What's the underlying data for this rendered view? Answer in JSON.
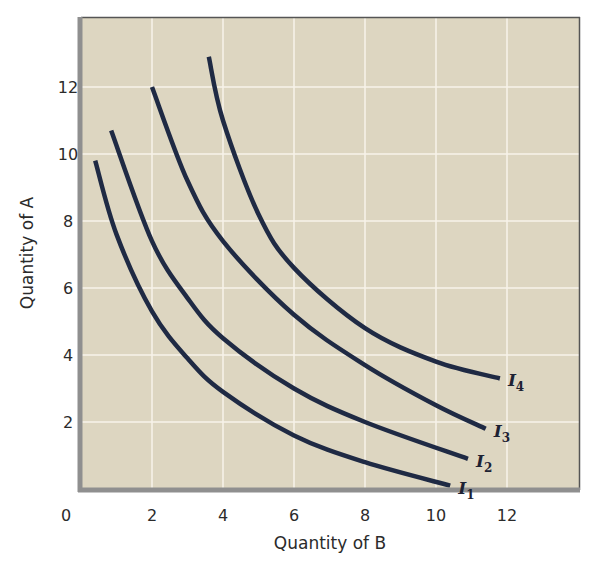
{
  "chart_data": {
    "type": "line",
    "title": "",
    "xlabel": "Quantity of B",
    "ylabel": "Quantity of A",
    "xlim": [
      0,
      14
    ],
    "ylim": [
      0,
      14
    ],
    "x_ticks": [
      0,
      2,
      4,
      6,
      8,
      10,
      12
    ],
    "y_ticks": [
      2,
      4,
      6,
      8,
      10,
      12
    ],
    "grid": true,
    "legend": "none (curves labeled inline at right end)",
    "series": [
      {
        "name": "I1",
        "label_main": "I",
        "label_sub": "1",
        "points": [
          [
            0.4,
            9.8
          ],
          [
            1,
            7.6
          ],
          [
            2,
            5.3
          ],
          [
            3,
            3.9
          ],
          [
            4,
            2.9
          ],
          [
            6,
            1.6
          ],
          [
            8,
            0.8
          ],
          [
            10.4,
            0.1
          ]
        ]
      },
      {
        "name": "I2",
        "label_main": "I",
        "label_sub": "2",
        "points": [
          [
            0.85,
            10.7
          ],
          [
            2,
            7.4
          ],
          [
            3,
            5.7
          ],
          [
            4,
            4.5
          ],
          [
            6,
            3.0
          ],
          [
            8,
            2.0
          ],
          [
            10.9,
            0.9
          ]
        ]
      },
      {
        "name": "I3",
        "label_main": "I",
        "label_sub": "3",
        "points": [
          [
            2,
            12.0
          ],
          [
            3,
            9.2
          ],
          [
            4,
            7.4
          ],
          [
            6,
            5.2
          ],
          [
            8,
            3.7
          ],
          [
            10,
            2.5
          ],
          [
            11.4,
            1.8
          ]
        ]
      },
      {
        "name": "I4",
        "label_main": "I",
        "label_sub": "4",
        "points": [
          [
            3.6,
            12.9
          ],
          [
            4,
            11.0
          ],
          [
            5,
            8.2
          ],
          [
            6,
            6.6
          ],
          [
            8,
            4.8
          ],
          [
            10,
            3.8
          ],
          [
            11.8,
            3.3
          ]
        ]
      }
    ]
  },
  "colors": {
    "plot_background": "#ddd6c1",
    "gridline": "#f7f3ea",
    "curve": "#1f2a44",
    "left_bottom_axis": "#8f8f8f",
    "top_right_border": "#555555"
  }
}
